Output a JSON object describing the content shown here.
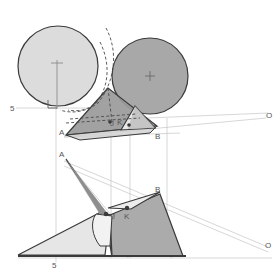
{
  "document": {
    "kind": "descriptive-geometry-drawing",
    "title": "Two cones in elevation and plan with intersection curve"
  },
  "colors": {
    "background": "#ffffff",
    "outline": "#3c3c3c",
    "light_circle_fill": "#dcdcdc",
    "dark_circle_fill": "#a8a8a8",
    "cone_fill_dark": "#9a9a9a",
    "cone_fill_mid": "#b5b5b5",
    "cone_fill_light": "#d6d6d6",
    "cone_fill_pale": "#e8e8e8",
    "thin_line": "#b0b0b0",
    "label_text": "#555555",
    "dashed_line": "#4a4a4a"
  },
  "elevation_view": {
    "name": "upper-elevation-view",
    "labels": {
      "height_mark": "5",
      "apex_a": "A",
      "apex_b": "B",
      "point_j": "J",
      "point_k": "K",
      "vanishing_o": "O"
    },
    "circles": [
      {
        "name": "light-circle",
        "cx": 58,
        "cy": 66,
        "r": 40,
        "fill": "#dcdcdc",
        "center_mark": "+"
      },
      {
        "name": "dark-circle",
        "cx": 150,
        "cy": 76,
        "r": 38,
        "fill": "#a8a8a8",
        "center_mark": "+"
      }
    ]
  },
  "plan_view": {
    "name": "lower-plan-view",
    "labels": {
      "baseline_mark": "5",
      "apex_a": "A",
      "apex_b": "B",
      "point_j": "J",
      "point_k": "K",
      "vanishing_o": "O"
    }
  },
  "annotations": {
    "right_angle_symbol": "⌐",
    "center_cross": "+"
  }
}
